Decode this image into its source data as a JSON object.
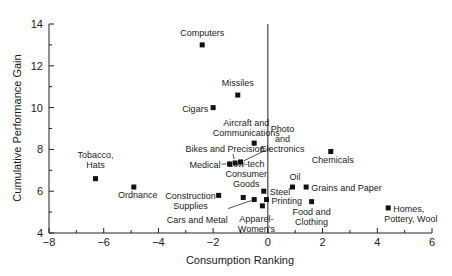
{
  "chart_data": {
    "type": "scatter",
    "title": "",
    "xlabel": "Consumption Ranking",
    "ylabel": "Cumulative Performance Gain",
    "xlim": [
      -8,
      6
    ],
    "ylim": [
      4,
      14
    ],
    "xticks": [
      -8,
      -6,
      -4,
      -2,
      0,
      2,
      4,
      6
    ],
    "yticks": [
      4,
      6,
      8,
      10,
      12,
      14
    ],
    "grid": false,
    "legend": null,
    "reference_line": {
      "x": 0
    },
    "points": [
      {
        "label": "Computers",
        "x": -2.4,
        "y": 13.0
      },
      {
        "label": "Missiles",
        "x": -1.1,
        "y": 10.6
      },
      {
        "label": "Cigars",
        "x": -2.0,
        "y": 10.0
      },
      {
        "label": "Aircraft and Communications",
        "x": -0.5,
        "y": 8.3
      },
      {
        "label": "Bikes and Precision",
        "x": -1.2,
        "y": 7.35
      },
      {
        "label": "Medical",
        "x": -1.4,
        "y": 7.3
      },
      {
        "label": "Photo and Electronics",
        "x": -1.0,
        "y": 7.4
      },
      {
        "label": "Tobacco, Hats",
        "x": -6.3,
        "y": 6.6
      },
      {
        "label": "Ordnance",
        "x": -4.9,
        "y": 6.2
      },
      {
        "label": "Construction Supplies",
        "x": -1.8,
        "y": 5.8
      },
      {
        "label": "Low-tech Consumer Goods",
        "x": -0.9,
        "y": 5.7
      },
      {
        "label": "Cars and Metal",
        "x": -0.5,
        "y": 5.6
      },
      {
        "label": "Apparel-Women's",
        "x": -0.2,
        "y": 5.3
      },
      {
        "label": "Steel",
        "x": -0.15,
        "y": 6.0
      },
      {
        "label": "Printing",
        "x": -0.05,
        "y": 5.6
      },
      {
        "label": "Oil",
        "x": 0.9,
        "y": 6.2
      },
      {
        "label": "Grains and Paper",
        "x": 1.4,
        "y": 6.2
      },
      {
        "label": "Food and Clothing",
        "x": 1.6,
        "y": 5.5
      },
      {
        "label": "Chemicals",
        "x": 2.3,
        "y": 7.9
      },
      {
        "label": "Homes, Pottery, Wool",
        "x": 4.4,
        "y": 5.2
      }
    ]
  }
}
